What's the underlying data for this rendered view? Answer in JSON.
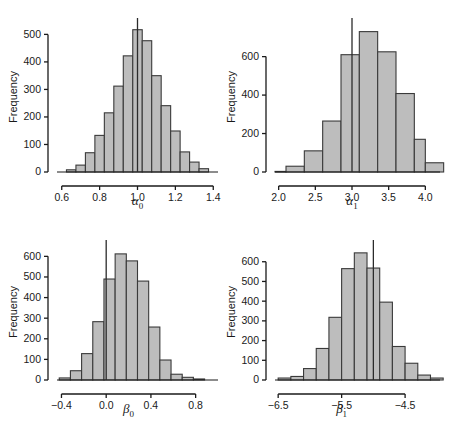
{
  "figure": {
    "background_color": "#ffffff",
    "bar_fill_color": "#bdbdbd",
    "bar_edge_color": "#3a3a3a",
    "axis_color": "#1a1a1a",
    "n_panels": 4
  },
  "panels": [
    {
      "id": "alpha0",
      "position": "top-left",
      "ylabel": "Frequency",
      "xlabel": "α0",
      "xlabel_base": "α",
      "xlabel_sub": "0",
      "xticks": [
        "0.6",
        "0.8",
        "1.0",
        "1.2",
        "1.4"
      ],
      "yticks": [
        "0",
        "100",
        "200",
        "300",
        "400",
        "500"
      ]
    },
    {
      "id": "alpha1",
      "position": "top-right",
      "ylabel": "Frequency",
      "xlabel": "α1",
      "xlabel_base": "α",
      "xlabel_sub": "1",
      "xticks": [
        "2.0",
        "2.5",
        "3.0",
        "3.5",
        "4.0"
      ],
      "yticks": [
        "0",
        "200",
        "400",
        "600"
      ]
    },
    {
      "id": "beta0",
      "position": "bottom-left",
      "ylabel": "Frequency",
      "xlabel": "β0",
      "xlabel_base": "β",
      "xlabel_sub": "0",
      "xticks": [
        "−0.4",
        "0.0",
        "0.4",
        "0.8"
      ],
      "yticks": [
        "0",
        "100",
        "200",
        "300",
        "400",
        "500",
        "600"
      ]
    },
    {
      "id": "beta1",
      "position": "bottom-right",
      "ylabel": "Frequency",
      "xlabel": "β1",
      "xlabel_base": "β",
      "xlabel_sub": "1",
      "xticks": [
        "−6.5",
        "−5.5",
        "−4.5"
      ],
      "yticks": [
        "0",
        "100",
        "200",
        "300",
        "400",
        "500",
        "600"
      ]
    }
  ],
  "chart_data": [
    {
      "type": "bar",
      "title": "",
      "subtitle": "",
      "xlabel": "α0",
      "ylabel": "Frequency",
      "grid": false,
      "legend": "none",
      "xlim": [
        0.575,
        1.425
      ],
      "ylim": [
        0,
        545
      ],
      "xticks": [
        0.6,
        0.8,
        1.0,
        1.2,
        1.4
      ],
      "yticks": [
        0,
        100,
        200,
        300,
        400,
        500
      ],
      "bin_width": 0.05,
      "bin_left_edges": [
        0.625,
        0.675,
        0.725,
        0.775,
        0.825,
        0.875,
        0.925,
        0.975,
        1.025,
        1.075,
        1.125,
        1.175,
        1.225,
        1.275,
        1.325
      ],
      "categories": [
        "0.625-0.675",
        "0.675-0.725",
        "0.725-0.775",
        "0.775-0.825",
        "0.825-0.875",
        "0.875-0.925",
        "0.925-0.975",
        "0.975-1.025",
        "1.025-1.075",
        "1.075-1.125",
        "1.125-1.175",
        "1.175-1.225",
        "1.225-1.275",
        "1.275-1.325",
        "1.325-1.375"
      ],
      "values": [
        8,
        25,
        70,
        133,
        215,
        312,
        422,
        517,
        477,
        350,
        241,
        149,
        73,
        36,
        12
      ],
      "reference_line": {
        "orientation": "vertical",
        "x": 1.0,
        "extends_above_bars": true
      }
    },
    {
      "type": "bar",
      "title": "",
      "subtitle": "",
      "xlabel": "α1",
      "ylabel": "Frequency",
      "grid": false,
      "legend": "none",
      "xlim": [
        1.95,
        4.2
      ],
      "ylim": [
        0,
        780
      ],
      "xticks": [
        2.0,
        2.5,
        3.0,
        3.5,
        4.0
      ],
      "yticks": [
        0,
        200,
        400,
        600
      ],
      "bin_width": 0.25,
      "bin_left_edges": [
        1.95,
        2.1,
        2.35,
        2.6,
        2.85,
        3.1,
        3.35,
        3.6,
        3.85,
        4.0
      ],
      "categories": [
        "1.95-2.1",
        "2.1-2.35",
        "2.35-2.6",
        "2.6-2.85",
        "2.85-3.1",
        "3.1-3.35",
        "3.35-3.6",
        "3.6-3.85",
        "3.85-4.0",
        "4.0-4.2"
      ],
      "values": [
        3,
        30,
        110,
        265,
        610,
        730,
        625,
        408,
        170,
        48
      ],
      "reference_line": {
        "orientation": "vertical",
        "x": 3.0,
        "extends_above_bars": true
      }
    },
    {
      "type": "bar",
      "title": "",
      "subtitle": "",
      "xlabel": "β0",
      "ylabel": "Frequency",
      "grid": false,
      "legend": "none",
      "xlim": [
        -0.44,
        1.0
      ],
      "ylim": [
        0,
        660
      ],
      "xticks": [
        -0.4,
        0.0,
        0.4,
        0.8
      ],
      "yticks": [
        0,
        100,
        200,
        300,
        400,
        500,
        600
      ],
      "bin_width": 0.1,
      "bin_left_edges": [
        -0.42,
        -0.32,
        -0.22,
        -0.12,
        -0.02,
        0.08,
        0.18,
        0.28,
        0.38,
        0.48,
        0.58,
        0.68,
        0.78
      ],
      "categories": [
        "-0.42--0.32",
        "-0.32--0.22",
        "-0.22--0.12",
        "-0.12--0.02",
        "-0.02-0.08",
        "0.08-0.18",
        "0.18-0.28",
        "0.28-0.38",
        "0.38-0.48",
        "0.48-0.58",
        "0.58-0.68",
        "0.68-0.78",
        "0.78-0.88"
      ],
      "values": [
        10,
        45,
        128,
        283,
        490,
        612,
        578,
        480,
        257,
        97,
        28,
        13,
        5
      ],
      "reference_line": {
        "orientation": "vertical",
        "x": 0.0,
        "extends_above_bars": true
      }
    },
    {
      "type": "bar",
      "title": "",
      "subtitle": "",
      "xlabel": "β1",
      "ylabel": "Frequency",
      "grid": false,
      "legend": "none",
      "xlim": [
        -6.55,
        -3.95
      ],
      "ylim": [
        0,
        690
      ],
      "xticks": [
        -6.5,
        -5.5,
        -4.5
      ],
      "yticks": [
        0,
        100,
        200,
        300,
        400,
        500,
        600
      ],
      "bin_width": 0.2,
      "bin_left_edges": [
        -6.5,
        -6.3,
        -6.1,
        -5.9,
        -5.7,
        -5.5,
        -5.3,
        -5.1,
        -4.9,
        -4.7,
        -4.5,
        -4.3,
        -4.1
      ],
      "categories": [
        "-6.5--6.3",
        "-6.3--6.1",
        "-6.1--5.9",
        "-5.9--5.7",
        "-5.7--5.5",
        "-5.5--5.3",
        "-5.3--5.1",
        "-5.1--4.9",
        "-4.9--4.7",
        "-4.7--4.5",
        "-4.5--4.3",
        "-4.3--4.1",
        "-4.1--3.95"
      ],
      "values": [
        10,
        18,
        58,
        160,
        318,
        565,
        645,
        568,
        395,
        170,
        85,
        25,
        10
      ],
      "reference_line": {
        "orientation": "vertical",
        "x": -5.0,
        "extends_above_bars": true
      }
    }
  ]
}
